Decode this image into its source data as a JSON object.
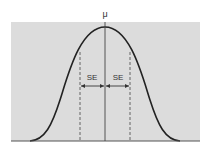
{
  "diagram": {
    "title": "",
    "type": "normal-distribution",
    "mean_label": "μ",
    "se_left_label": "SE",
    "se_right_label": "SE",
    "colors": {
      "background": "#dcdcdc",
      "curve": "#222222",
      "lines": "#444444",
      "page": "#ffffff"
    }
  }
}
